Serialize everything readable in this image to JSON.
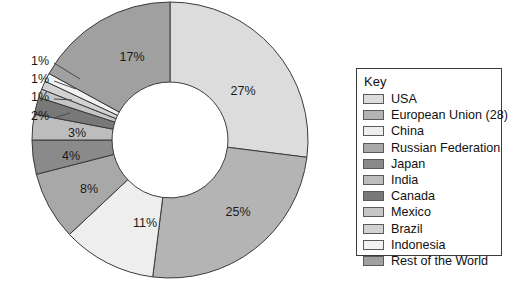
{
  "chart_data": {
    "type": "pie",
    "variant": "donut",
    "title": "",
    "subtitle": "",
    "xlabel": "",
    "ylabel": "",
    "legend_position": "right",
    "legend_title": "Key",
    "grid": false,
    "categories": [
      "USA",
      "European Union (28)",
      "China",
      "Russian Federation",
      "Japan",
      "India",
      "Canada",
      "Mexico",
      "Brazil",
      "Indonesia",
      "Rest of the World"
    ],
    "values": [
      27,
      25,
      11,
      8,
      4,
      3,
      2,
      1,
      1,
      1,
      17
    ],
    "data_labels": [
      "27%",
      "25%",
      "11%",
      "8%",
      "4%",
      "3%",
      "2%",
      "1%",
      "1%",
      "1%",
      "17%"
    ],
    "unit": "%",
    "colors": [
      "#dcdcdc",
      "#b4b4b4",
      "#eeeeee",
      "#a8a8a8",
      "#8a8a8a",
      "#bdbdbd",
      "#787878",
      "#c6c6c6",
      "#d2d2d2",
      "#f2f2f2",
      "#a0a0a0"
    ],
    "slice_stroke": "#3a3a3a",
    "inner_radius_ratio": 0.42,
    "start_angle_deg": 0,
    "direction": "clockwise"
  },
  "legend": {
    "title": "Key",
    "items": [
      {
        "label": "USA",
        "color": "#dcdcdc"
      },
      {
        "label": "European Union (28)",
        "color": "#b4b4b4"
      },
      {
        "label": "China",
        "color": "#eeeeee"
      },
      {
        "label": "Russian Federation",
        "color": "#a8a8a8"
      },
      {
        "label": "Japan",
        "color": "#8a8a8a"
      },
      {
        "label": "India",
        "color": "#bdbdbd"
      },
      {
        "label": "Canada",
        "color": "#787878"
      },
      {
        "label": "Mexico",
        "color": "#c6c6c6"
      },
      {
        "label": "Brazil",
        "color": "#d2d2d2"
      },
      {
        "label": "Indonesia",
        "color": "#f2f2f2"
      },
      {
        "label": "Rest of the World",
        "color": "#a0a0a0"
      }
    ]
  },
  "inline_labels": [
    {
      "text": "27%",
      "x": 243,
      "y": 92
    },
    {
      "text": "25%",
      "x": 238,
      "y": 213
    },
    {
      "text": "11%",
      "x": 145,
      "y": 224
    },
    {
      "text": "8%",
      "x": 89,
      "y": 190
    },
    {
      "text": "4%",
      "x": 71,
      "y": 157
    },
    {
      "text": "3%",
      "x": 77,
      "y": 134
    },
    {
      "text": "17%",
      "x": 132,
      "y": 58
    }
  ],
  "callouts": [
    {
      "text": "1%",
      "x": 40,
      "y": 62
    },
    {
      "text": "1%",
      "x": 40,
      "y": 80
    },
    {
      "text": "1%",
      "x": 40,
      "y": 98
    },
    {
      "text": "2%",
      "x": 40,
      "y": 117
    }
  ]
}
